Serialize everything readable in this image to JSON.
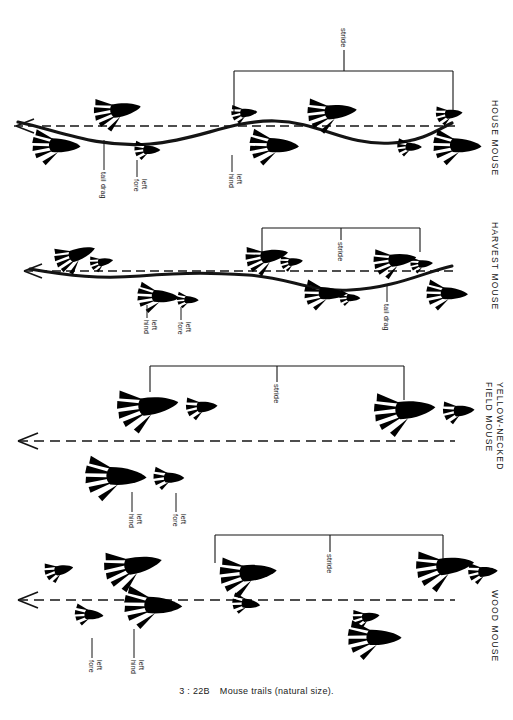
{
  "figure": {
    "caption_number": "3 : 22B",
    "caption_text": "Mouse trails (natural size).",
    "ink_color": "#141414",
    "paper_color": "#ffffff"
  },
  "panels": [
    {
      "id": "house-mouse",
      "species": "HOUSE MOUSE",
      "direction_arrow": "left-arrow",
      "has_tail_drag": true,
      "callouts": [
        {
          "key": "tail-drag",
          "text": "tail drag"
        },
        {
          "key": "left-fore",
          "text": "left\nfore"
        },
        {
          "key": "left-hind",
          "text": "left\nhind"
        }
      ],
      "stride": {
        "label": "stride"
      }
    },
    {
      "id": "harvest-mouse",
      "species": "HARVEST MOUSE",
      "direction_arrow": "left-arrow",
      "has_tail_drag": true,
      "callouts": [
        {
          "key": "left-hind",
          "text": "left\nhind"
        },
        {
          "key": "left-fore",
          "text": "left\nfore"
        },
        {
          "key": "tail-drag",
          "text": "tail drag"
        }
      ],
      "stride": {
        "label": "stride"
      }
    },
    {
      "id": "yellow-necked-field-mouse",
      "species": "YELLOW-NECKED\nFIELD MOUSE",
      "direction_arrow": "left-arrow",
      "has_tail_drag": false,
      "callouts": [
        {
          "key": "left-hind",
          "text": "left\nhind"
        },
        {
          "key": "left-fore",
          "text": "left\nfore"
        }
      ],
      "stride": {
        "label": "stride"
      }
    },
    {
      "id": "wood-mouse",
      "species": "WOOD MOUSE",
      "direction_arrow": "left-arrow",
      "has_tail_drag": false,
      "callouts": [
        {
          "key": "left-fore",
          "text": "left\nfore"
        },
        {
          "key": "left-hind",
          "text": "left\nhind"
        }
      ],
      "stride": {
        "label": "stride"
      }
    }
  ]
}
